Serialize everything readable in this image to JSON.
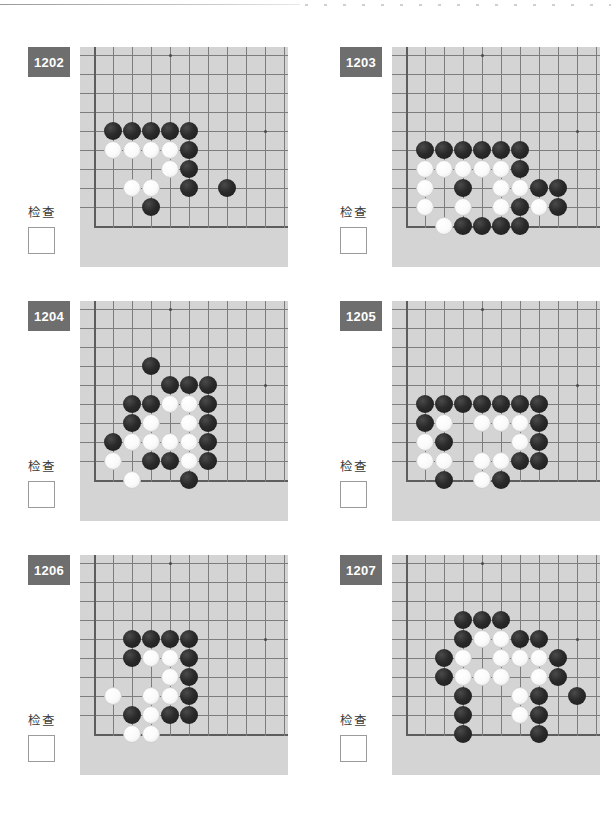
{
  "page": {
    "check_label": "检查",
    "badge_color": "#6e6e6e",
    "board_color": "#d4d4d4",
    "grid_line_color": "#7d7d7d",
    "black_stone_color": "#222222",
    "white_stone_color": "#ffffff"
  },
  "board_spec": {
    "cols": 11,
    "rows": 11,
    "cell": 19,
    "origin_x": 14,
    "origin_y": 8,
    "left_edge_col": 1,
    "bottom_edge_row": 10,
    "stone_diameter": 18,
    "hoshi": [
      [
        5,
        1
      ],
      [
        10,
        5
      ]
    ]
  },
  "puzzles": [
    {
      "id": "1202",
      "check_label": "检查",
      "checked": false,
      "stones": [
        {
          "c": 2,
          "r": 5,
          "color": "black"
        },
        {
          "c": 3,
          "r": 5,
          "color": "black"
        },
        {
          "c": 4,
          "r": 5,
          "color": "black"
        },
        {
          "c": 5,
          "r": 5,
          "color": "black"
        },
        {
          "c": 6,
          "r": 5,
          "color": "black"
        },
        {
          "c": 2,
          "r": 6,
          "color": "white"
        },
        {
          "c": 3,
          "r": 6,
          "color": "white"
        },
        {
          "c": 4,
          "r": 6,
          "color": "white"
        },
        {
          "c": 5,
          "r": 6,
          "color": "white"
        },
        {
          "c": 6,
          "r": 6,
          "color": "black"
        },
        {
          "c": 5,
          "r": 7,
          "color": "white"
        },
        {
          "c": 6,
          "r": 7,
          "color": "black"
        },
        {
          "c": 3,
          "r": 8,
          "color": "white"
        },
        {
          "c": 4,
          "r": 8,
          "color": "white"
        },
        {
          "c": 6,
          "r": 8,
          "color": "black"
        },
        {
          "c": 8,
          "r": 8,
          "color": "black"
        },
        {
          "c": 4,
          "r": 9,
          "color": "black"
        }
      ]
    },
    {
      "id": "1203",
      "check_label": "检查",
      "checked": false,
      "stones": [
        {
          "c": 2,
          "r": 6,
          "color": "black"
        },
        {
          "c": 3,
          "r": 6,
          "color": "black"
        },
        {
          "c": 4,
          "r": 6,
          "color": "black"
        },
        {
          "c": 5,
          "r": 6,
          "color": "black"
        },
        {
          "c": 6,
          "r": 6,
          "color": "black"
        },
        {
          "c": 7,
          "r": 6,
          "color": "black"
        },
        {
          "c": 2,
          "r": 7,
          "color": "white"
        },
        {
          "c": 3,
          "r": 7,
          "color": "white"
        },
        {
          "c": 4,
          "r": 7,
          "color": "white"
        },
        {
          "c": 5,
          "r": 7,
          "color": "white"
        },
        {
          "c": 6,
          "r": 7,
          "color": "white"
        },
        {
          "c": 7,
          "r": 7,
          "color": "black"
        },
        {
          "c": 2,
          "r": 8,
          "color": "white"
        },
        {
          "c": 4,
          "r": 8,
          "color": "black"
        },
        {
          "c": 6,
          "r": 8,
          "color": "white"
        },
        {
          "c": 7,
          "r": 8,
          "color": "white"
        },
        {
          "c": 8,
          "r": 8,
          "color": "black"
        },
        {
          "c": 9,
          "r": 8,
          "color": "black"
        },
        {
          "c": 2,
          "r": 9,
          "color": "white"
        },
        {
          "c": 4,
          "r": 9,
          "color": "white"
        },
        {
          "c": 6,
          "r": 9,
          "color": "white"
        },
        {
          "c": 7,
          "r": 9,
          "color": "black"
        },
        {
          "c": 8,
          "r": 9,
          "color": "white"
        },
        {
          "c": 9,
          "r": 9,
          "color": "black"
        },
        {
          "c": 3,
          "r": 10,
          "color": "white"
        },
        {
          "c": 4,
          "r": 10,
          "color": "black"
        },
        {
          "c": 5,
          "r": 10,
          "color": "black"
        },
        {
          "c": 6,
          "r": 10,
          "color": "black"
        },
        {
          "c": 7,
          "r": 10,
          "color": "black"
        }
      ]
    },
    {
      "id": "1204",
      "check_label": "检查",
      "checked": false,
      "stones": [
        {
          "c": 4,
          "r": 4,
          "color": "black"
        },
        {
          "c": 5,
          "r": 5,
          "color": "black"
        },
        {
          "c": 6,
          "r": 5,
          "color": "black"
        },
        {
          "c": 7,
          "r": 5,
          "color": "black"
        },
        {
          "c": 3,
          "r": 6,
          "color": "black"
        },
        {
          "c": 4,
          "r": 6,
          "color": "black"
        },
        {
          "c": 5,
          "r": 6,
          "color": "white"
        },
        {
          "c": 6,
          "r": 6,
          "color": "white"
        },
        {
          "c": 7,
          "r": 6,
          "color": "black"
        },
        {
          "c": 3,
          "r": 7,
          "color": "black"
        },
        {
          "c": 4,
          "r": 7,
          "color": "white"
        },
        {
          "c": 6,
          "r": 7,
          "color": "white"
        },
        {
          "c": 7,
          "r": 7,
          "color": "black"
        },
        {
          "c": 2,
          "r": 8,
          "color": "black"
        },
        {
          "c": 3,
          "r": 8,
          "color": "white"
        },
        {
          "c": 4,
          "r": 8,
          "color": "white"
        },
        {
          "c": 5,
          "r": 8,
          "color": "white"
        },
        {
          "c": 6,
          "r": 8,
          "color": "white"
        },
        {
          "c": 7,
          "r": 8,
          "color": "black"
        },
        {
          "c": 2,
          "r": 9,
          "color": "white"
        },
        {
          "c": 4,
          "r": 9,
          "color": "black"
        },
        {
          "c": 5,
          "r": 9,
          "color": "black"
        },
        {
          "c": 6,
          "r": 9,
          "color": "white"
        },
        {
          "c": 7,
          "r": 9,
          "color": "black"
        },
        {
          "c": 3,
          "r": 10,
          "color": "white"
        },
        {
          "c": 6,
          "r": 10,
          "color": "black"
        }
      ]
    },
    {
      "id": "1205",
      "check_label": "检查",
      "checked": false,
      "stones": [
        {
          "c": 2,
          "r": 6,
          "color": "black"
        },
        {
          "c": 3,
          "r": 6,
          "color": "black"
        },
        {
          "c": 4,
          "r": 6,
          "color": "black"
        },
        {
          "c": 5,
          "r": 6,
          "color": "black"
        },
        {
          "c": 6,
          "r": 6,
          "color": "black"
        },
        {
          "c": 7,
          "r": 6,
          "color": "black"
        },
        {
          "c": 8,
          "r": 6,
          "color": "black"
        },
        {
          "c": 2,
          "r": 7,
          "color": "black"
        },
        {
          "c": 3,
          "r": 7,
          "color": "white"
        },
        {
          "c": 5,
          "r": 7,
          "color": "white"
        },
        {
          "c": 6,
          "r": 7,
          "color": "white"
        },
        {
          "c": 7,
          "r": 7,
          "color": "white"
        },
        {
          "c": 8,
          "r": 7,
          "color": "black"
        },
        {
          "c": 2,
          "r": 8,
          "color": "white"
        },
        {
          "c": 3,
          "r": 8,
          "color": "black"
        },
        {
          "c": 7,
          "r": 8,
          "color": "white"
        },
        {
          "c": 8,
          "r": 8,
          "color": "black"
        },
        {
          "c": 2,
          "r": 9,
          "color": "white"
        },
        {
          "c": 3,
          "r": 9,
          "color": "white"
        },
        {
          "c": 5,
          "r": 9,
          "color": "white"
        },
        {
          "c": 6,
          "r": 9,
          "color": "white"
        },
        {
          "c": 7,
          "r": 9,
          "color": "black"
        },
        {
          "c": 8,
          "r": 9,
          "color": "black"
        },
        {
          "c": 3,
          "r": 10,
          "color": "black"
        },
        {
          "c": 5,
          "r": 10,
          "color": "white"
        },
        {
          "c": 6,
          "r": 10,
          "color": "black"
        }
      ]
    },
    {
      "id": "1206",
      "check_label": "检查",
      "checked": false,
      "stones": [
        {
          "c": 3,
          "r": 5,
          "color": "black"
        },
        {
          "c": 4,
          "r": 5,
          "color": "black"
        },
        {
          "c": 5,
          "r": 5,
          "color": "black"
        },
        {
          "c": 6,
          "r": 5,
          "color": "black"
        },
        {
          "c": 3,
          "r": 6,
          "color": "black"
        },
        {
          "c": 4,
          "r": 6,
          "color": "white"
        },
        {
          "c": 5,
          "r": 6,
          "color": "white"
        },
        {
          "c": 6,
          "r": 6,
          "color": "black"
        },
        {
          "c": 5,
          "r": 7,
          "color": "white"
        },
        {
          "c": 6,
          "r": 7,
          "color": "black"
        },
        {
          "c": 2,
          "r": 8,
          "color": "white"
        },
        {
          "c": 4,
          "r": 8,
          "color": "white"
        },
        {
          "c": 5,
          "r": 8,
          "color": "white"
        },
        {
          "c": 6,
          "r": 8,
          "color": "black"
        },
        {
          "c": 3,
          "r": 9,
          "color": "black"
        },
        {
          "c": 4,
          "r": 9,
          "color": "white"
        },
        {
          "c": 5,
          "r": 9,
          "color": "black"
        },
        {
          "c": 6,
          "r": 9,
          "color": "black"
        },
        {
          "c": 3,
          "r": 10,
          "color": "white"
        },
        {
          "c": 4,
          "r": 10,
          "color": "white"
        }
      ]
    },
    {
      "id": "1207",
      "check_label": "检查",
      "checked": false,
      "stones": [
        {
          "c": 4,
          "r": 4,
          "color": "black"
        },
        {
          "c": 5,
          "r": 4,
          "color": "black"
        },
        {
          "c": 6,
          "r": 4,
          "color": "black"
        },
        {
          "c": 4,
          "r": 5,
          "color": "black"
        },
        {
          "c": 5,
          "r": 5,
          "color": "white"
        },
        {
          "c": 6,
          "r": 5,
          "color": "white"
        },
        {
          "c": 7,
          "r": 5,
          "color": "black"
        },
        {
          "c": 8,
          "r": 5,
          "color": "black"
        },
        {
          "c": 3,
          "r": 6,
          "color": "black"
        },
        {
          "c": 4,
          "r": 6,
          "color": "white"
        },
        {
          "c": 6,
          "r": 6,
          "color": "white"
        },
        {
          "c": 7,
          "r": 6,
          "color": "white"
        },
        {
          "c": 8,
          "r": 6,
          "color": "white"
        },
        {
          "c": 9,
          "r": 6,
          "color": "black"
        },
        {
          "c": 3,
          "r": 7,
          "color": "black"
        },
        {
          "c": 4,
          "r": 7,
          "color": "white"
        },
        {
          "c": 5,
          "r": 7,
          "color": "white"
        },
        {
          "c": 6,
          "r": 7,
          "color": "white"
        },
        {
          "c": 8,
          "r": 7,
          "color": "white"
        },
        {
          "c": 9,
          "r": 7,
          "color": "black"
        },
        {
          "c": 4,
          "r": 8,
          "color": "black"
        },
        {
          "c": 7,
          "r": 8,
          "color": "white"
        },
        {
          "c": 8,
          "r": 8,
          "color": "black"
        },
        {
          "c": 10,
          "r": 8,
          "color": "black"
        },
        {
          "c": 4,
          "r": 9,
          "color": "black"
        },
        {
          "c": 7,
          "r": 9,
          "color": "white"
        },
        {
          "c": 8,
          "r": 9,
          "color": "black"
        },
        {
          "c": 4,
          "r": 10,
          "color": "black"
        },
        {
          "c": 8,
          "r": 10,
          "color": "black"
        }
      ]
    }
  ]
}
